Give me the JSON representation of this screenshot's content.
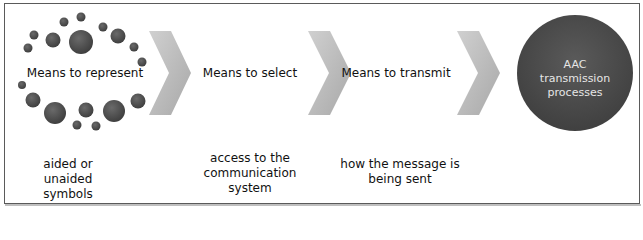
{
  "diagram": {
    "steps": [
      {
        "label": "Means to represent",
        "description": "aided or unaided symbols"
      },
      {
        "label": "Means to select",
        "description": "access to the communication system"
      },
      {
        "label": "Means to transmit",
        "description": "how the message is being sent"
      }
    ],
    "result": {
      "label": "AAC transmission processes"
    },
    "connector_icon": "chevron-right-icon",
    "colors": {
      "dot": "#4a4a4a",
      "chevron": "#c0c0c0",
      "circle": "#4d4d4d",
      "circle_text": "#e6e6e6",
      "border": "#5a5a5a"
    }
  }
}
